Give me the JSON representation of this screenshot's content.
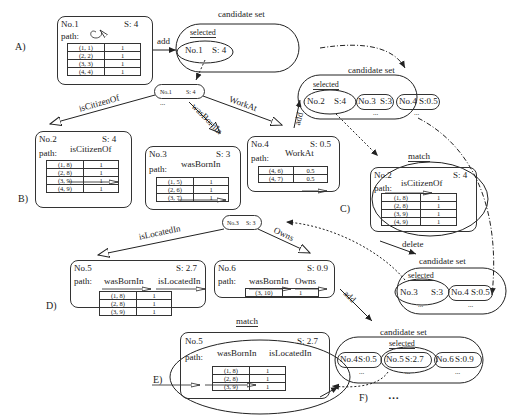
{
  "panels": {
    "A": {
      "label": "A)",
      "node": {
        "id": "No.1",
        "score": "S: 4",
        "path_label": "path:",
        "table": [
          [
            "(1, 1)",
            "1"
          ],
          [
            "(2, 2)",
            "1"
          ],
          [
            "(3, 3)",
            "1"
          ],
          [
            "(4, 4)",
            "1"
          ]
        ]
      },
      "add_label": "add",
      "candidate_set": {
        "title": "candidate set",
        "selected_label": "selected",
        "items": [
          {
            "id": "No.1",
            "score": "S: 4"
          }
        ]
      }
    },
    "expand1": {
      "parent": {
        "id": "No.1",
        "score": "S: 4",
        "ellipsis": "..."
      },
      "edges": [
        "isCitizenOf",
        "wasBornIn",
        "WorkAt"
      ]
    },
    "B": {
      "label": "B)",
      "nodes": [
        {
          "id": "No.2",
          "score": "S: 4",
          "path_label": "path:",
          "relations": [
            "isCitizenOf"
          ],
          "table": [
            [
              "(1, 8)",
              "1"
            ],
            [
              "(2, 8)",
              "1"
            ],
            [
              "(3, 9)",
              "1"
            ],
            [
              "(4, 9)",
              "1"
            ]
          ]
        },
        {
          "id": "No.3",
          "score": "S: 3",
          "path_label": "path:",
          "relations": [
            "wasBornIn"
          ],
          "table": [
            [
              "(1, 5)",
              "1"
            ],
            [
              "(2, 6)",
              "1"
            ],
            [
              "(3, 7)",
              "1"
            ]
          ]
        },
        {
          "id": "No.4",
          "score": "S: 0.5",
          "path_label": "path:",
          "relations": [
            "WorkAt"
          ],
          "table": [
            [
              "(4, 6)",
              "0.5"
            ],
            [
              "(4, 7)",
              "0.5"
            ]
          ]
        }
      ],
      "add_label": "add",
      "candidate_set": {
        "title": "candidate set",
        "selected_label": "selected",
        "items": [
          {
            "id": "No.2",
            "score": "S:4"
          },
          {
            "id": "No.3",
            "score": "S:3"
          },
          {
            "id": "No.4",
            "score": "S:0.5"
          }
        ],
        "ellipsis": "..."
      }
    },
    "C": {
      "label": "C)",
      "match_label": "match",
      "node": {
        "id": "No.2",
        "score": "S: 4",
        "path_label": "path:",
        "relations": [
          "isCitizenOf"
        ],
        "table": [
          [
            "(1, 8)",
            "1"
          ],
          [
            "(2, 8)",
            "1"
          ],
          [
            "(3, 9)",
            "1"
          ],
          [
            "(4, 9)",
            "1"
          ]
        ]
      },
      "delete_label": "delete",
      "candidate_set": {
        "title": "candidate set",
        "selected_label": "selected",
        "items": [
          {
            "id": "No.3",
            "score": "S:3"
          },
          {
            "id": "No.4",
            "score": "S:0.5"
          }
        ],
        "ellipsis": "..."
      }
    },
    "expand2": {
      "parent": {
        "id": "No.3",
        "score": "S: 3"
      },
      "edges": [
        "isLocatedIn",
        "Owns"
      ]
    },
    "D": {
      "label": "D)",
      "nodes": [
        {
          "id": "No.5",
          "score": "S: 2.7",
          "path_label": "path:",
          "relations": [
            "wasBornIn",
            "isLocatedIn"
          ],
          "table": [
            [
              "(1, 8)",
              "1"
            ],
            [
              "(2, 8)",
              "1"
            ],
            [
              "(3, 9)",
              "1"
            ]
          ]
        },
        {
          "id": "No.6",
          "score": "S: 0.9",
          "path_label": "path:",
          "relations": [
            "wasBornIn",
            "Owns"
          ],
          "table": [
            [
              "(3, 10)",
              "1"
            ]
          ]
        }
      ],
      "add_label": "add"
    },
    "E": {
      "label": "E)",
      "match_label": "match",
      "node": {
        "id": "No.5",
        "score": "S: 2.7",
        "path_label": "path:",
        "relations": [
          "wasBornIn",
          "isLocatedIn"
        ],
        "table": [
          [
            "(1, 8)",
            "1"
          ],
          [
            "(2, 8)",
            "1"
          ],
          [
            "(3, 9)",
            "1"
          ]
        ]
      }
    },
    "F": {
      "label": "F)",
      "continuation": "…",
      "candidate_set": {
        "title": "candidate set",
        "selected_label": "selected",
        "items": [
          {
            "id": "No.4",
            "score": "S:0.5"
          },
          {
            "id": "No.5",
            "score": "S:2.7"
          },
          {
            "id": "No.6",
            "score": "S:0.9"
          }
        ],
        "ellipsis": "..."
      }
    }
  }
}
